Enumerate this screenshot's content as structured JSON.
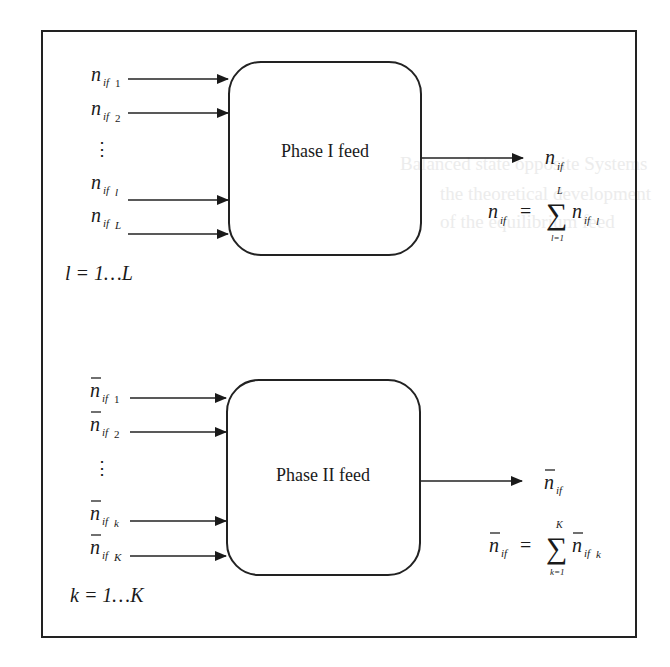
{
  "diagram": {
    "phase1": {
      "box_label": "Phase I feed",
      "inputs": [
        {
          "base": "n",
          "sub": "if",
          "idx": "1",
          "bar": false
        },
        {
          "base": "n",
          "sub": "if",
          "idx": "2",
          "bar": false
        },
        {
          "base": "n",
          "sub": "if",
          "idx": "l",
          "bar": false
        },
        {
          "base": "n",
          "sub": "if",
          "idx": "L",
          "bar": false
        }
      ],
      "ellipsis": "⋮",
      "index_range": "l = 1…L",
      "output": {
        "base": "n",
        "sub": "if",
        "bar": false
      },
      "equation": {
        "lhs_base": "n",
        "lhs_sub": "if",
        "equals": "=",
        "sum": "∑",
        "upper": "L",
        "lower": "l=1",
        "term_base": "n",
        "term_sub": "if",
        "term_idx": "l"
      }
    },
    "phase2": {
      "box_label": "Phase II feed",
      "inputs": [
        {
          "base": "n",
          "sub": "if",
          "idx": "1",
          "bar": true
        },
        {
          "base": "n",
          "sub": "if",
          "idx": "2",
          "bar": true
        },
        {
          "base": "n",
          "sub": "if",
          "idx": "k",
          "bar": true
        },
        {
          "base": "n",
          "sub": "if",
          "idx": "K",
          "bar": true
        }
      ],
      "ellipsis": "⋮",
      "index_range": "k = 1…K",
      "output": {
        "base": "n",
        "sub": "if",
        "bar": true
      },
      "equation": {
        "lhs_base": "n",
        "lhs_sub": "if",
        "equals": "=",
        "sum": "∑",
        "upper": "K",
        "lower": "k=1",
        "term_base": "n",
        "term_sub": "if",
        "term_idx": "k"
      }
    }
  }
}
